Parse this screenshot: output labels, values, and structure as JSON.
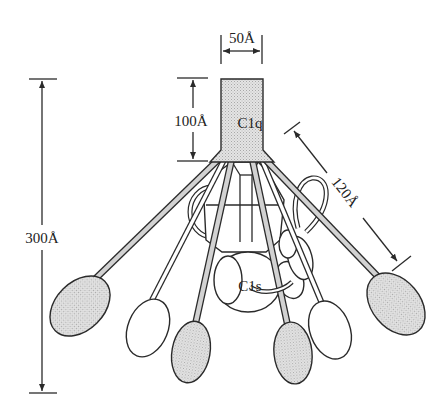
{
  "diagram": {
    "labels": {
      "c1q": "C1q",
      "c1s": "C1s",
      "width_stalk": "50Å",
      "height_stalk": "100Å",
      "total_height": "300Å",
      "arm_length": "120Å"
    },
    "dimensions": [
      {
        "name": "stalk-width",
        "value": "50Å",
        "orientation": "horizontal"
      },
      {
        "name": "stalk-height",
        "value": "100Å",
        "orientation": "vertical"
      },
      {
        "name": "total-height",
        "value": "300Å",
        "orientation": "vertical"
      },
      {
        "name": "arm-length",
        "value": "120Å",
        "orientation": "diagonal"
      }
    ],
    "components": {
      "stalk": "C1q",
      "globular_heads_shaded": 4,
      "globular_heads_white": 2,
      "central_protease": "C1s"
    },
    "colors": {
      "stroke": "#2a2a2a",
      "shade": "#d6d6d6",
      "background": "#ffffff"
    }
  }
}
